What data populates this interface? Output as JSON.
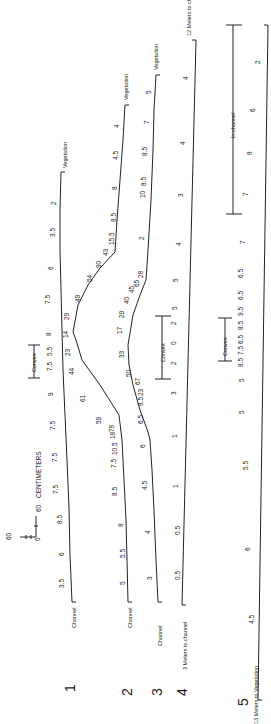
{
  "figure": {
    "orientation": "rotated 90 degrees counter-clockwise",
    "scale_bar": {
      "unit_label": "CENTIMETERS",
      "min_label": "0",
      "max_label": "60",
      "side_label": "60"
    }
  },
  "profiles": [
    {
      "id": "1",
      "start_label": "Channel",
      "end_label": "Vegetation",
      "values": [
        "3.5",
        "6",
        "8.5",
        "7.5",
        "7.5",
        "7.5",
        "9",
        "7.5",
        "5.5",
        "8",
        "7.5",
        "6",
        "3.5",
        "2"
      ],
      "convex_label": "Convex",
      "points": [
        [
          72,
          602
        ],
        [
          70,
          555
        ],
        [
          69,
          508
        ],
        [
          67,
          460
        ],
        [
          65,
          415
        ],
        [
          63,
          370
        ],
        [
          62,
          330
        ],
        [
          61,
          290
        ],
        [
          60,
          250
        ],
        [
          60,
          210
        ],
        [
          61,
          172
        ]
      ]
    },
    {
      "id": "2",
      "start_label": "Channel",
      "end_label": "Vegetation",
      "values": [
        "5",
        "5.5",
        "8",
        "8.5",
        "7.5",
        "10.5",
        "18",
        "78",
        "59",
        "61",
        "44",
        "23",
        "14",
        "29",
        "49",
        "54",
        "90",
        "43",
        "15.5",
        "8.5",
        "8",
        "4.5",
        "4"
      ],
      "points": [
        [
          128,
          602
        ],
        [
          127,
          560
        ],
        [
          126,
          520
        ],
        [
          124,
          480
        ],
        [
          122,
          440
        ],
        [
          119,
          415
        ],
        [
          100,
          385
        ],
        [
          82,
          360
        ],
        [
          76,
          340
        ],
        [
          73,
          332
        ],
        [
          78,
          305
        ],
        [
          88,
          285
        ],
        [
          100,
          268
        ],
        [
          115,
          252
        ],
        [
          117,
          220
        ],
        [
          120,
          180
        ],
        [
          123,
          140
        ],
        [
          125,
          105
        ]
      ]
    },
    {
      "id": "3",
      "start_label": "Channel",
      "end_label": "Vegetation",
      "values": [
        "3",
        "4",
        "4.5",
        "6",
        "6.5",
        "8.5",
        "23",
        "67",
        "50",
        "33",
        "17",
        "29",
        "40",
        "45",
        "65",
        "28",
        "2",
        "10",
        "8.5",
        "8.5",
        "7",
        "5"
      ],
      "points": [
        [
          158,
          602
        ],
        [
          156,
          560
        ],
        [
          154,
          510
        ],
        [
          152,
          470
        ],
        [
          150,
          440
        ],
        [
          148,
          432
        ],
        [
          140,
          410
        ],
        [
          133,
          385
        ],
        [
          129,
          365
        ],
        [
          128,
          345
        ],
        [
          133,
          315
        ],
        [
          140,
          295
        ],
        [
          146,
          280
        ],
        [
          148,
          250
        ],
        [
          151,
          200
        ],
        [
          153,
          150
        ],
        [
          154,
          110
        ],
        [
          156,
          75
        ]
      ]
    },
    {
      "id": "4",
      "start_label": "3 Meters to channel",
      "end_label": "12 Meters to channel",
      "values": [
        "0.5",
        "0.5",
        "1",
        "1",
        "3",
        "2",
        "0",
        "2",
        "5",
        "5",
        "4",
        "3",
        "4",
        "4"
      ],
      "convex_label": "Convex",
      "points": [
        [
          182,
          605
        ],
        [
          196,
          40
        ]
      ]
    },
    {
      "id": "5",
      "start_label": "13 Meters to Vegetation",
      "end_label": "",
      "values": [
        "4.5",
        "6",
        "5.5",
        "5",
        "5",
        "8.5",
        "7.5",
        "6.5",
        "8.5",
        "9.5",
        "6.5",
        "6.5",
        "7",
        "7",
        "8",
        "6",
        "2"
      ],
      "convex_label": "Convex",
      "in_channel_label": "In channel",
      "points": [
        [
          258,
          700
        ],
        [
          268,
          25
        ]
      ]
    }
  ],
  "profile_numbers": [
    "1",
    "2",
    "3",
    "4",
    "5"
  ]
}
